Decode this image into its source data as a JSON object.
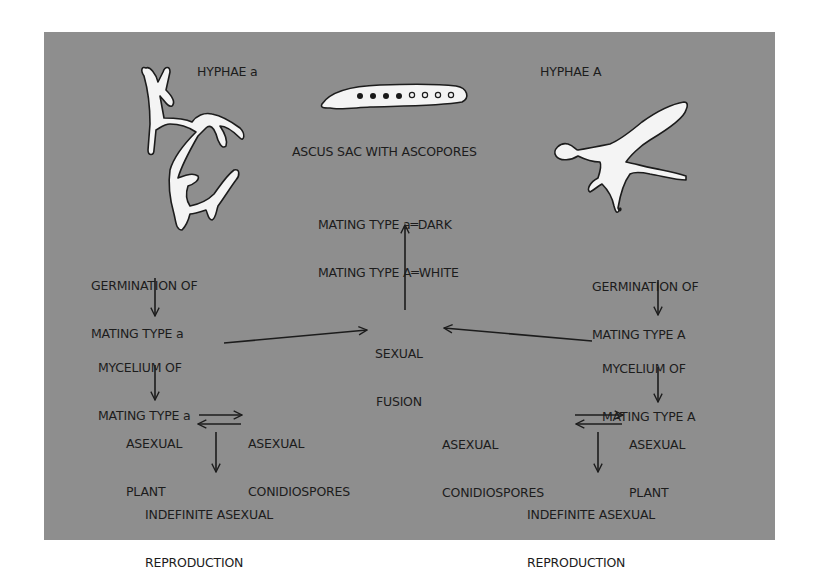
{
  "diagram": {
    "colors": {
      "background": "#ffffff",
      "panel": "#8e8e8e",
      "text": "#1c1c1c",
      "hyphae_fill": "#f4f4f4",
      "spore_dark": "#1a1a1a",
      "spore_white": "#f4f4f4"
    },
    "top": {
      "hyphae_a_label": "HYPHAE a",
      "hyphae_A_label": "HYPHAE A",
      "ascus_label": "ASCUS SAC WITH ASCOPORES",
      "ascus_spores": {
        "dark_count": 4,
        "white_count": 4
      },
      "legend_line1": "MATING TYPE a═DARK",
      "legend_line2": "MATING TYPE A═WHITE"
    },
    "left": {
      "germination_line1": "GERMINATION OF",
      "germination_line2": "MATING TYPE a",
      "mycelium_line1": "MYCELIUM OF",
      "mycelium_line2": "MATING TYPE a",
      "plant_line1": "ASEXUAL",
      "plant_line2": "PLANT",
      "conidio_line1": "ASEXUAL",
      "conidio_line2": "CONIDIOSPORES",
      "indef_line1": "INDEFINITE ASEXUAL",
      "indef_line2": "REPRODUCTION"
    },
    "center": {
      "fusion_line1": "SEXUAL",
      "fusion_line2": "FUSION"
    },
    "right": {
      "germination_line1": "GERMINATION OF",
      "germination_line2": "MATING TYPE A",
      "mycelium_line1": "MYCELIUM OF",
      "mycelium_line2": "MATING TYPE A",
      "conidio_line1": "ASEXUAL",
      "conidio_line2": "CONIDIOSPORES",
      "plant_line1": "ASEXUAL",
      "plant_line2": "PLANT",
      "indef_line1": "INDEFINITE ASEXUAL",
      "indef_line2": "REPRODUCTION"
    },
    "edges": [
      {
        "from": "germination-a",
        "to": "mycelium-a"
      },
      {
        "from": "mycelium-a",
        "to": "sexual-fusion"
      },
      {
        "from": "mycelium-A",
        "to": "sexual-fusion"
      },
      {
        "from": "sexual-fusion",
        "to": "ascus-legend"
      },
      {
        "from": "germination-A",
        "to": "mycelium-A"
      },
      {
        "from": "mycelium-a",
        "to": "asexual-plant-a"
      },
      {
        "from": "asexual-plant-a",
        "to": "asexual-conidiospores-a"
      },
      {
        "from": "asexual-conidiospores-a",
        "to": "asexual-plant-a"
      },
      {
        "from": "asexual-plant-a",
        "to": "indefinite-asexual-a"
      },
      {
        "from": "mycelium-A",
        "to": "asexual-plant-A"
      },
      {
        "from": "asexual-conidiospores-A",
        "to": "asexual-plant-A"
      },
      {
        "from": "asexual-plant-A",
        "to": "asexual-conidiospores-A"
      },
      {
        "from": "asexual-plant-A",
        "to": "indefinite-asexual-A"
      }
    ]
  }
}
